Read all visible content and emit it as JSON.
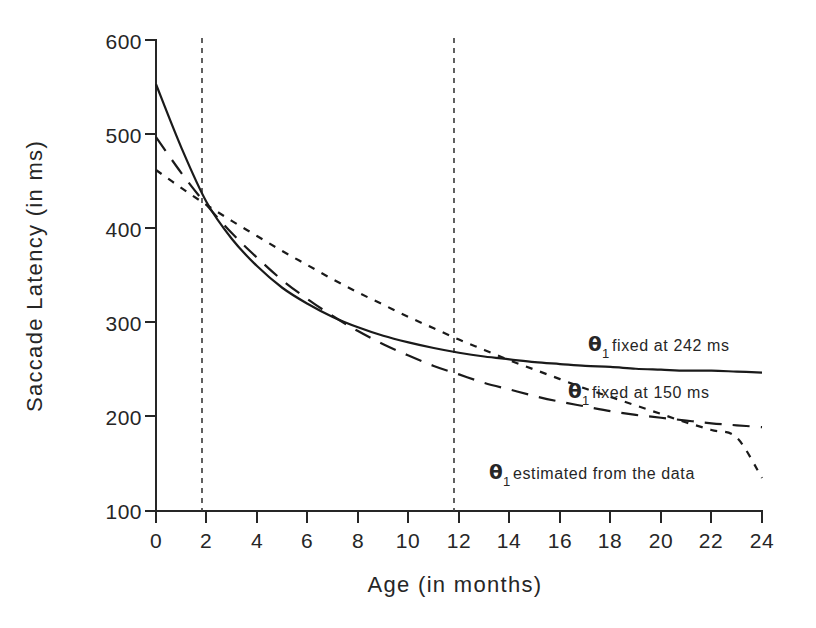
{
  "chart_data": {
    "type": "line",
    "title": "",
    "xlabel": "Age (in months)",
    "ylabel": "Saccade Latency (in ms)",
    "xlim": [
      0,
      24
    ],
    "ylim": [
      100,
      600
    ],
    "xticks": [
      0,
      2,
      4,
      6,
      8,
      10,
      12,
      14,
      16,
      18,
      20,
      22,
      24
    ],
    "yticks": [
      100,
      200,
      300,
      400,
      500,
      600
    ],
    "grid": false,
    "legend_position": "inline-annotations",
    "reference_lines": [
      {
        "name": "vline-age-2",
        "axis": "x",
        "value": 2,
        "style": "dashed"
      },
      {
        "name": "vline-age-12",
        "axis": "x",
        "value": 12,
        "style": "dashed"
      }
    ],
    "x": [
      0,
      1,
      2,
      3,
      4,
      5,
      6,
      7,
      8,
      9,
      10,
      11,
      12,
      13,
      14,
      15,
      16,
      17,
      18,
      19,
      20,
      21,
      22,
      23,
      24
    ],
    "series": [
      {
        "name": "theta1-fixed-242",
        "label": "fixed at 242 ms",
        "label_prefix": "θ",
        "label_subscript": "1",
        "style": "solid",
        "values": [
          553,
          486,
          428,
          389,
          360,
          337,
          320,
          306,
          295,
          286,
          279,
          273,
          268,
          264,
          261,
          258,
          256,
          254,
          253,
          251,
          250,
          249,
          249,
          248,
          247
        ]
      },
      {
        "name": "theta1-fixed-150",
        "label": "fixed at 150 ms",
        "label_prefix": "θ",
        "label_subscript": "1",
        "style": "dashed",
        "values": [
          497,
          459,
          425,
          395,
          369,
          345,
          325,
          307,
          291,
          277,
          265,
          254,
          245,
          236,
          229,
          222,
          216,
          211,
          206,
          202,
          199,
          196,
          193,
          191,
          189
        ]
      },
      {
        "name": "theta1-estimated",
        "label": "estimated from the data",
        "label_prefix": "θ",
        "label_subscript": "1",
        "style": "dotted",
        "values": [
          462,
          443,
          425,
          408,
          392,
          376,
          361,
          346,
          332,
          319,
          306,
          294,
          282,
          271,
          260,
          250,
          240,
          230,
          221,
          212,
          203,
          194,
          186,
          178,
          135
        ]
      }
    ],
    "annotations": [
      {
        "name": "annotation-242",
        "text": "θ₁ fixed at 242 ms",
        "x": 16.8,
        "y": 285
      },
      {
        "name": "annotation-150",
        "text": "θ₁ fixed at 150 ms",
        "x": 16.0,
        "y": 232
      },
      {
        "name": "annotation-estimated",
        "text": "θ₁ estimated from the data",
        "x": 12.8,
        "y": 148
      }
    ]
  },
  "axes": {
    "ylabel": "Saccade Latency (in ms)",
    "xlabel": "Age (in months)",
    "ytick_labels": [
      "600",
      "500",
      "400",
      "300",
      "200",
      "100"
    ],
    "xtick_labels": [
      "0",
      "2",
      "4",
      "6",
      "8",
      "10",
      "12",
      "14",
      "16",
      "18",
      "20",
      "22",
      "24"
    ]
  },
  "annotations": {
    "theta_symbol": "θ",
    "theta_subscript": "1",
    "label_1": "fixed at 242 ms",
    "label_2": "fixed at 150 ms",
    "label_3": "estimated from the data"
  },
  "colors": {
    "ink": "#1a1a1a",
    "background": "#ffffff",
    "reference_line": "#3a3a3a"
  }
}
